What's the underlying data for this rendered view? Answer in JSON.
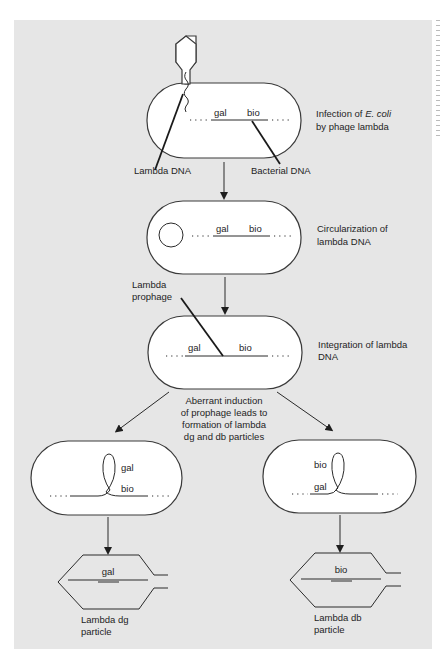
{
  "figure": {
    "background_color": "#e6e6e6",
    "steps": [
      {
        "id": "infection",
        "caption_lines": [
          "Infection of E. coli",
          "by phage lambda"
        ],
        "gene_labels": [
          "gal",
          "bio"
        ],
        "callouts": [
          "Lambda DNA",
          "Bacterial DNA"
        ]
      },
      {
        "id": "circularization",
        "caption_lines": [
          "Circularization of",
          "lambda DNA"
        ],
        "gene_labels": [
          "gal",
          "bio"
        ]
      },
      {
        "id": "integration",
        "caption_lines": [
          "Integration of lambda",
          "DNA"
        ],
        "gene_labels": [
          "gal",
          "bio"
        ],
        "callouts": [
          "Lambda",
          "prophage"
        ]
      },
      {
        "id": "aberrant-induction",
        "caption_lines": [
          "Aberrant induction",
          "of prophage leads to",
          "formation of lambda",
          "dg and db particles"
        ]
      },
      {
        "id": "dg-excision",
        "gene_labels": [
          "gal",
          "bio"
        ]
      },
      {
        "id": "db-excision",
        "gene_labels": [
          "bio",
          "gal"
        ]
      },
      {
        "id": "dg-particle",
        "gene_label": "gal",
        "caption_lines": [
          "Lambda dg",
          "particle"
        ]
      },
      {
        "id": "db-particle",
        "gene_label": "bio",
        "caption_lines": [
          "Lambda db",
          "particle"
        ]
      }
    ]
  }
}
